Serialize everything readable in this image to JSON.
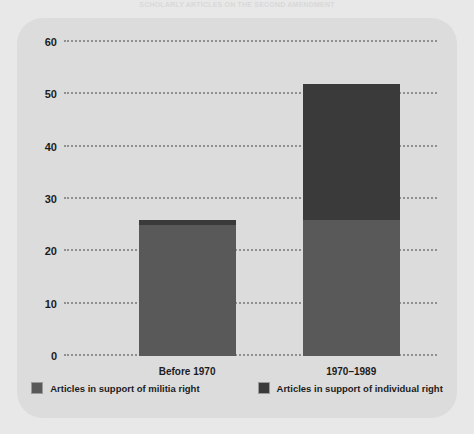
{
  "caption": "SCHOLARLY ARTICLES ON THE SECOND AMENDMENT",
  "chart_data": {
    "type": "bar",
    "title": "",
    "xlabel": "",
    "ylabel": "",
    "categories": [
      "Before 1970",
      "1970–1989"
    ],
    "series": [
      {
        "name": "Articles in support of militia right",
        "color": "#595959",
        "values": [
          25,
          26
        ]
      },
      {
        "name": "Articles in support of individual right",
        "color": "#3a3a3a",
        "values": [
          1,
          26
        ]
      }
    ],
    "stacked": true,
    "totals": [
      26,
      52
    ],
    "ylim": [
      0,
      60
    ],
    "yticks": [
      0,
      10,
      20,
      30,
      40,
      50,
      60
    ],
    "ytick_labels": [
      "0",
      "10",
      "20",
      "30",
      "40",
      "50",
      "60"
    ],
    "grid": true,
    "gridline_style": "dotted",
    "legend_position": "bottom",
    "panel_color": "#dcdcdc",
    "background_color": "#e8e8e8"
  }
}
